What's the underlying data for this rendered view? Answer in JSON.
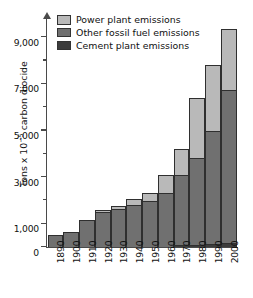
{
  "chart_data": {
    "type": "bar",
    "subtype": "stacked-bar",
    "title": "",
    "xlabel": "",
    "ylabel": "Tons x 10⁻⁵ carbon diocide",
    "ylabel_parts": {
      "prefix": "Tons x 10",
      "exponent": "−5",
      "suffix": " carbon diocide"
    },
    "categories": [
      "1890",
      "1900",
      "1910",
      "1920",
      "1930",
      "1940",
      "1950",
      "1960",
      "1970",
      "1980",
      "1990",
      "2000"
    ],
    "series": [
      {
        "name": "Cement plant emissions",
        "color": "#3c3c3c",
        "values": [
          0,
          0,
          0,
          0,
          0,
          0,
          0,
          0,
          60,
          80,
          110,
          160
        ]
      },
      {
        "name": "Other fossil fuel emissions",
        "color": "#707070",
        "values": [
          500,
          620,
          1150,
          1480,
          1620,
          1780,
          1950,
          2300,
          2990,
          3720,
          4840,
          6540
        ]
      },
      {
        "name": "Power plant emissions",
        "color": "#b9b9b9",
        "values": [
          0,
          0,
          0,
          80,
          100,
          270,
          350,
          750,
          1150,
          2550,
          2850,
          2650
        ]
      }
    ],
    "totals": [
      500,
      620,
      1150,
      1560,
      1720,
      2050,
      2300,
      3050,
      4200,
      6350,
      7800,
      9350
    ],
    "ylim": [
      0,
      9800
    ],
    "yticks": [
      0,
      1000,
      3000,
      5000,
      7000,
      9000
    ],
    "ytick_labels": [
      "0",
      "1,000",
      "3,000",
      "5,000",
      "7,000",
      "9,000"
    ],
    "yminor_ticks": [
      2000,
      4000,
      6000,
      8000
    ],
    "grid": false,
    "legend_position": "top-left",
    "legend": [
      {
        "label": "Power plant emissions",
        "color": "#b9b9b9"
      },
      {
        "label": "Other fossil fuel emissions",
        "color": "#707070"
      },
      {
        "label": "Cement plant emissions",
        "color": "#3c3c3c"
      }
    ]
  }
}
